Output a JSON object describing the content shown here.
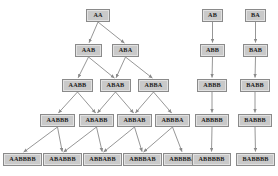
{
  "diagram": {
    "background_color": "#ffffff",
    "node_fill_color": "#c9c9c9",
    "node_border_color": "#8a8a8a",
    "node_highlight_color": "#e2e2e2",
    "edge_color": "#8a8a8a",
    "text_color": "#1c1c1c",
    "width": 278,
    "height": 176
  },
  "nodes": [
    {
      "id": "n0",
      "label": "AA",
      "x": 86,
      "y": 9,
      "w": 24,
      "group": "triangle",
      "row": 0,
      "col": 0
    },
    {
      "id": "n1",
      "label": "AAB",
      "x": 75,
      "y": 44,
      "w": 27,
      "group": "triangle",
      "row": 1,
      "col": 0
    },
    {
      "id": "n2",
      "label": "ABA",
      "x": 112,
      "y": 44,
      "w": 27,
      "group": "triangle",
      "row": 1,
      "col": 1
    },
    {
      "id": "n3",
      "label": "AABB",
      "x": 62,
      "y": 79,
      "w": 31,
      "group": "triangle",
      "row": 2,
      "col": 0
    },
    {
      "id": "n4",
      "label": "ABAB",
      "x": 100,
      "y": 79,
      "w": 31,
      "group": "triangle",
      "row": 2,
      "col": 1
    },
    {
      "id": "n5",
      "label": "ABBA",
      "x": 138,
      "y": 79,
      "w": 31,
      "group": "triangle",
      "row": 2,
      "col": 2
    },
    {
      "id": "n6",
      "label": "AABBB",
      "x": 40,
      "y": 114,
      "w": 35,
      "group": "triangle",
      "row": 3,
      "col": 0
    },
    {
      "id": "n7",
      "label": "ABABB",
      "x": 79,
      "y": 114,
      "w": 35,
      "group": "triangle",
      "row": 3,
      "col": 1
    },
    {
      "id": "n8",
      "label": "ABBAB",
      "x": 117,
      "y": 114,
      "w": 35,
      "group": "triangle",
      "row": 3,
      "col": 2
    },
    {
      "id": "n9",
      "label": "ABBBA",
      "x": 155,
      "y": 114,
      "w": 35,
      "group": "triangle",
      "row": 3,
      "col": 3
    },
    {
      "id": "n10",
      "label": "AABBBB",
      "x": 3,
      "y": 153,
      "w": 39,
      "group": "triangle",
      "row": 4,
      "col": 0
    },
    {
      "id": "n11",
      "label": "ABABBB",
      "x": 43,
      "y": 153,
      "w": 39,
      "group": "triangle",
      "row": 4,
      "col": 1
    },
    {
      "id": "n12",
      "label": "ABBABB",
      "x": 83,
      "y": 153,
      "w": 39,
      "group": "triangle",
      "row": 4,
      "col": 2
    },
    {
      "id": "n13",
      "label": "ABBBAB",
      "x": 123,
      "y": 153,
      "w": 39,
      "group": "triangle",
      "row": 4,
      "col": 3
    },
    {
      "id": "n14",
      "label": "ABBBBA",
      "x": 163,
      "y": 153,
      "w": 39,
      "group": "triangle",
      "row": 4,
      "col": 4
    },
    {
      "id": "n15",
      "label": "AB",
      "x": 202,
      "y": 9,
      "w": 21,
      "group": "chain-ab",
      "row": 0,
      "col": 0
    },
    {
      "id": "n16",
      "label": "ABB",
      "x": 200,
      "y": 44,
      "w": 25,
      "group": "chain-ab",
      "row": 1,
      "col": 0
    },
    {
      "id": "n17",
      "label": "ABBB",
      "x": 197,
      "y": 79,
      "w": 30,
      "group": "chain-ab",
      "row": 2,
      "col": 0
    },
    {
      "id": "n18",
      "label": "ABBBB",
      "x": 195,
      "y": 114,
      "w": 34,
      "group": "chain-ab",
      "row": 3,
      "col": 0
    },
    {
      "id": "n19",
      "label": "ABBBBB",
      "x": 192,
      "y": 153,
      "w": 39,
      "group": "chain-ab",
      "row": 4,
      "col": 0
    },
    {
      "id": "n20",
      "label": "BA",
      "x": 245,
      "y": 9,
      "w": 21,
      "group": "chain-ba",
      "row": 0,
      "col": 0
    },
    {
      "id": "n21",
      "label": "BAB",
      "x": 243,
      "y": 44,
      "w": 25,
      "group": "chain-ba",
      "row": 1,
      "col": 0
    },
    {
      "id": "n22",
      "label": "BABB",
      "x": 240,
      "y": 79,
      "w": 30,
      "group": "chain-ba",
      "row": 2,
      "col": 0
    },
    {
      "id": "n23",
      "label": "BABBB",
      "x": 238,
      "y": 114,
      "w": 34,
      "group": "chain-ba",
      "row": 3,
      "col": 0
    },
    {
      "id": "n24",
      "label": "BABBBB",
      "x": 236,
      "y": 153,
      "w": 39,
      "group": "chain-ba",
      "row": 4,
      "col": 0
    }
  ],
  "edges": [
    {
      "from": "n0",
      "to": "n1"
    },
    {
      "from": "n0",
      "to": "n2"
    },
    {
      "from": "n1",
      "to": "n3"
    },
    {
      "from": "n1",
      "to": "n4"
    },
    {
      "from": "n2",
      "to": "n4"
    },
    {
      "from": "n2",
      "to": "n5"
    },
    {
      "from": "n3",
      "to": "n6"
    },
    {
      "from": "n3",
      "to": "n7"
    },
    {
      "from": "n4",
      "to": "n7"
    },
    {
      "from": "n4",
      "to": "n8"
    },
    {
      "from": "n5",
      "to": "n8"
    },
    {
      "from": "n5",
      "to": "n9"
    },
    {
      "from": "n6",
      "to": "n10"
    },
    {
      "from": "n6",
      "to": "n11"
    },
    {
      "from": "n7",
      "to": "n11"
    },
    {
      "from": "n7",
      "to": "n12"
    },
    {
      "from": "n8",
      "to": "n12"
    },
    {
      "from": "n8",
      "to": "n13"
    },
    {
      "from": "n9",
      "to": "n13"
    },
    {
      "from": "n9",
      "to": "n14"
    },
    {
      "from": "n15",
      "to": "n16"
    },
    {
      "from": "n16",
      "to": "n17"
    },
    {
      "from": "n17",
      "to": "n18"
    },
    {
      "from": "n18",
      "to": "n19"
    },
    {
      "from": "n20",
      "to": "n21"
    },
    {
      "from": "n21",
      "to": "n22"
    },
    {
      "from": "n22",
      "to": "n23"
    },
    {
      "from": "n23",
      "to": "n24"
    }
  ]
}
